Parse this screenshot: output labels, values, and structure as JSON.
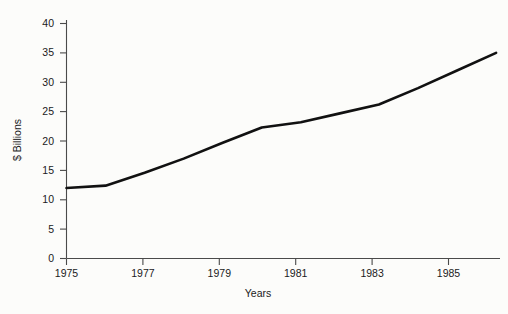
{
  "chart_data": {
    "type": "line",
    "title": "",
    "xlabel": "Years",
    "ylabel": "$ Billions",
    "x": [
      1975,
      1976,
      1977,
      1978,
      1979,
      1980,
      1981,
      1982,
      1983,
      1984,
      1985,
      1986
    ],
    "values": [
      12.0,
      12.4,
      14.6,
      17.0,
      19.7,
      22.3,
      23.2,
      24.7,
      26.2,
      29.0,
      32.0,
      35.0
    ],
    "series": [
      {
        "name": "",
        "values": [
          12.0,
          12.4,
          14.6,
          17.0,
          19.7,
          22.3,
          23.2,
          24.7,
          26.2,
          29.0,
          32.0,
          35.0
        ]
      }
    ],
    "xlim": [
      1975,
      1986.1
    ],
    "ylim": [
      0,
      42
    ],
    "ytick_labels": [
      "0",
      "5",
      "10",
      "15",
      "20",
      "25",
      "30",
      "35",
      "40"
    ],
    "ytick_values": [
      0,
      5,
      10,
      15,
      20,
      25,
      30,
      35,
      40
    ],
    "xtick_labels": [
      "1975",
      "1977",
      "1979",
      "1981",
      "1983",
      "1985"
    ],
    "xtick_values": [
      1975,
      1977,
      1979,
      1981,
      1983,
      1985
    ],
    "grid": false,
    "legend": "none",
    "line_color": "#111111",
    "axis_color": "#4a4a4a",
    "background_color": "#fcfcfa"
  },
  "labels": {
    "ylabel": "$ Billions",
    "xlabel": "Years",
    "y0": "0",
    "y5": "5",
    "y10": "10",
    "y15": "15",
    "y20": "20",
    "y25": "25",
    "y30": "30",
    "y35": "35",
    "y40": "40",
    "x1975": "1975",
    "x1977": "1977",
    "x1979": "1979",
    "x1981": "1981",
    "x1983": "1983",
    "x1985": "1985"
  }
}
